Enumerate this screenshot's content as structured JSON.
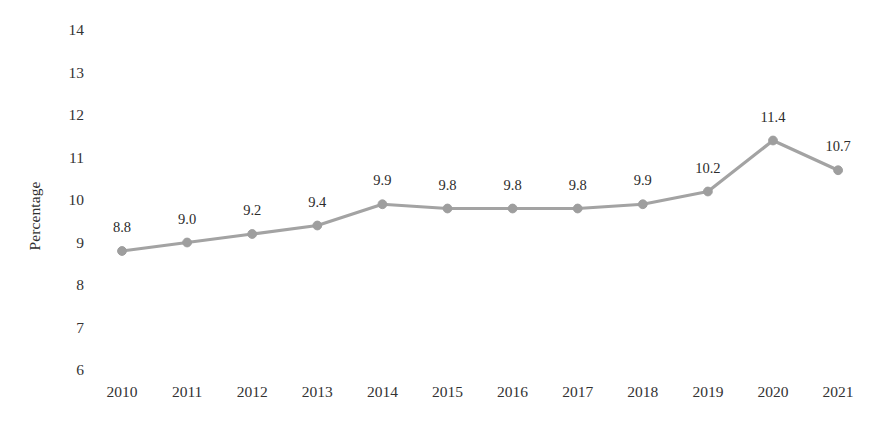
{
  "chart_data": {
    "type": "line",
    "title": "",
    "subtitle": "",
    "xlabel": "",
    "ylabel": "Percentage",
    "categories": [
      "2010",
      "2011",
      "2012",
      "2013",
      "2014",
      "2015",
      "2016",
      "2017",
      "2018",
      "2019",
      "2020",
      "2021"
    ],
    "values": [
      8.8,
      9.0,
      9.2,
      9.4,
      9.9,
      9.8,
      9.8,
      9.8,
      9.9,
      10.2,
      11.4,
      10.7
    ],
    "point_labels": [
      "8.8",
      "9.0",
      "9.2",
      "9.4",
      "9.9",
      "9.8",
      "9.8",
      "9.8",
      "9.9",
      "10.2",
      "11.4",
      "10.7"
    ],
    "ylim": [
      6,
      14
    ],
    "ytick_values": [
      6,
      7,
      8,
      9,
      10,
      11,
      12,
      13,
      14
    ],
    "ytick_labels": [
      "6",
      "7",
      "8",
      "9",
      "10",
      "11",
      "12",
      "13",
      "14"
    ],
    "grid": false,
    "legend": false,
    "legend_position": "none",
    "series_color": "#a3a3a3",
    "marker": "circle",
    "marker_color": "#9e9e9e",
    "background_color": "#ffffff",
    "text_color": "#333333"
  }
}
